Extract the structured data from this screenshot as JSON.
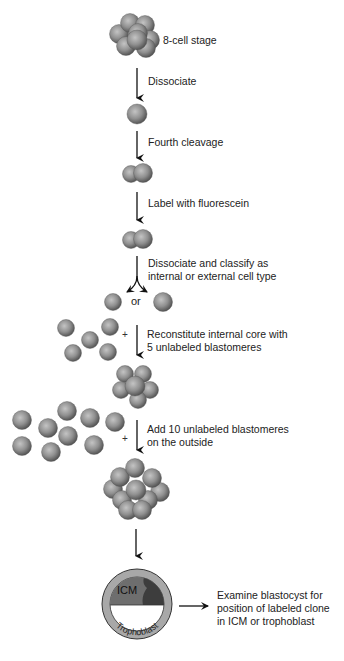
{
  "diagram": {
    "steps": [
      {
        "id": "8-cell",
        "label": "8-cell stage"
      },
      {
        "id": "dissociate",
        "label": "Dissociate"
      },
      {
        "id": "fourth-cleavage",
        "label": "Fourth cleavage"
      },
      {
        "id": "label",
        "label": "Label with fluorescein"
      },
      {
        "id": "classify",
        "line1": "Dissociate and classify as",
        "line2": "internal or external cell type"
      },
      {
        "id": "reconstitute",
        "line1": "Reconstitute internal core with",
        "line2": "5 unlabeled blastomeres"
      },
      {
        "id": "add-outside",
        "line1": "Add 10 unlabeled blastomeres",
        "line2": "on the outside"
      },
      {
        "id": "examine",
        "line1": "Examine blastocyst for",
        "line2": "position of labeled clone",
        "line3": "in ICM or trophoblast"
      }
    ],
    "or_label": "or",
    "plus_symbol": "+",
    "blastocyst": {
      "icm_label": "ICM",
      "trophoblast_label": "Trophoblast"
    },
    "colors": {
      "cell_light": "#b5b5b5",
      "cell_mid": "#8a8a8a",
      "cell_dark": "#4a4a4a",
      "trophoblast_ring": "#a8a8a8",
      "icm_fill": "#6e6e6e",
      "labeled_clone": "#3d3d3d",
      "arrow": "#111111"
    }
  }
}
